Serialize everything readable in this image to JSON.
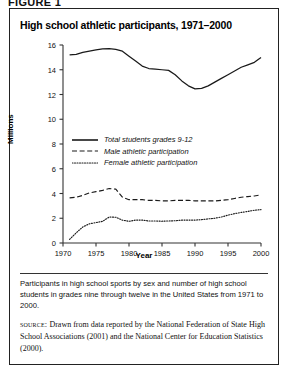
{
  "figure_label": "FIGURE 1",
  "chart_title": "High school athletic participants, 1971–2000",
  "caption": "Participants in high school sports by sex and number of high school students in grades nine through twelve in the United States from 1971 to 2000.",
  "source": {
    "kicker": "source:",
    "text": "Drawn from data reported by the National Federation of State High School Associations (2001) and the National Center for Education Statistics (2000)."
  },
  "axis": {
    "y_ticks": [
      "0",
      "2",
      "4",
      "6",
      "8",
      "10",
      "12",
      "14",
      "16"
    ],
    "x_ticks": [
      "1970",
      "1975",
      "1980",
      "1985",
      "1990",
      "1995",
      "2000"
    ]
  },
  "legend": [
    {
      "label": "Total students grades 9-12",
      "style": "solid"
    },
    {
      "label": "Male athletic participation",
      "style": "dashed"
    },
    {
      "label": "Female athletic participation",
      "style": "dotted"
    }
  ],
  "colors": {
    "line": "#1a1a1a",
    "axis": "#333333",
    "border": "#222222",
    "background": "#ffffff"
  },
  "chart_data": {
    "type": "line",
    "title": "High school athletic participants, 1971–2000",
    "xlabel": "Year",
    "ylabel": "Millions",
    "xlim": [
      1970,
      2000
    ],
    "ylim": [
      0,
      16
    ],
    "grid": false,
    "legend_position": "center-left",
    "x": [
      1971,
      1972,
      1973,
      1974,
      1975,
      1976,
      1977,
      1978,
      1979,
      1980,
      1981,
      1982,
      1983,
      1984,
      1985,
      1986,
      1987,
      1988,
      1989,
      1990,
      1991,
      1992,
      1993,
      1994,
      1995,
      1996,
      1997,
      1998,
      1999,
      2000
    ],
    "series": [
      {
        "name": "Total students grades 9-12",
        "style": "solid",
        "values": [
          15.2,
          15.25,
          15.4,
          15.5,
          15.6,
          15.68,
          15.7,
          15.65,
          15.5,
          15.1,
          14.7,
          14.3,
          14.1,
          14.05,
          14.0,
          13.95,
          13.6,
          13.1,
          12.7,
          12.45,
          12.5,
          12.7,
          13.0,
          13.3,
          13.6,
          13.9,
          14.2,
          14.4,
          14.6,
          15.0
        ]
      },
      {
        "name": "Male athletic participation",
        "style": "dashed",
        "values": [
          3.65,
          3.7,
          3.85,
          4.05,
          4.15,
          4.25,
          4.4,
          4.35,
          3.7,
          3.5,
          3.5,
          3.5,
          3.45,
          3.45,
          3.4,
          3.4,
          3.45,
          3.45,
          3.45,
          3.4,
          3.4,
          3.4,
          3.4,
          3.45,
          3.5,
          3.6,
          3.7,
          3.75,
          3.8,
          3.9
        ]
      },
      {
        "name": "Female athletic participation",
        "style": "dotted",
        "values": [
          0.3,
          0.82,
          1.3,
          1.55,
          1.65,
          1.75,
          2.1,
          2.08,
          1.85,
          1.75,
          1.85,
          1.85,
          1.78,
          1.78,
          1.76,
          1.78,
          1.8,
          1.85,
          1.85,
          1.85,
          1.89,
          1.95,
          2.0,
          2.1,
          2.25,
          2.37,
          2.47,
          2.55,
          2.65,
          2.7
        ]
      }
    ]
  }
}
